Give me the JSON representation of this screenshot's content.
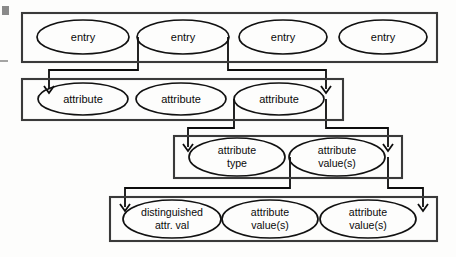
{
  "diagram": {
    "canvas": {
      "width": 456,
      "height": 257
    },
    "colors": {
      "box_stroke": "#3a3a3a",
      "ellipse_stroke": "#111111",
      "connector_stroke": "#0d0d0d",
      "text": "#0a0a0a",
      "background": "#fdfdfc",
      "edge_mark": "#8a8a8a"
    },
    "groups": [
      {
        "id": "entries-group",
        "name": "entry-group",
        "rect": {
          "x": 22,
          "y": 13,
          "w": 415,
          "h": 49
        },
        "nodes": [
          {
            "id": "entry-1",
            "label": "entry",
            "cx": 83,
            "cy": 37,
            "rx": 46,
            "ry": 17
          },
          {
            "id": "entry-2",
            "label": "entry",
            "cx": 183,
            "cy": 37,
            "rx": 46,
            "ry": 17
          },
          {
            "id": "entry-3",
            "label": "entry",
            "cx": 283,
            "cy": 37,
            "rx": 44,
            "ry": 17
          },
          {
            "id": "entry-4",
            "label": "entry",
            "cx": 383,
            "cy": 37,
            "rx": 44,
            "ry": 17
          }
        ]
      },
      {
        "id": "attributes-group",
        "name": "attribute-group",
        "rect": {
          "x": 22,
          "y": 79,
          "w": 321,
          "h": 41
        },
        "nodes": [
          {
            "id": "attribute-1",
            "label": "attribute",
            "cx": 83,
            "cy": 99,
            "rx": 45,
            "ry": 16
          },
          {
            "id": "attribute-2",
            "label": "attribute",
            "cx": 181,
            "cy": 99,
            "rx": 45,
            "ry": 16
          },
          {
            "id": "attribute-3",
            "label": "attribute",
            "cx": 279,
            "cy": 99,
            "rx": 45,
            "ry": 16
          }
        ]
      },
      {
        "id": "attribute-parts-group",
        "name": "attribute-parts-group",
        "rect": {
          "x": 174,
          "y": 136,
          "w": 228,
          "h": 42
        },
        "nodes": [
          {
            "id": "attribute-type",
            "label_line1": "attribute",
            "label_line2": "type",
            "cx": 237,
            "cy": 157,
            "rx": 48,
            "ry": 19
          },
          {
            "id": "attribute-values",
            "label_line1": "attribute",
            "label_line2": "value(s)",
            "cx": 337,
            "cy": 157,
            "rx": 48,
            "ry": 19
          }
        ]
      },
      {
        "id": "values-group",
        "name": "attribute-values-group",
        "rect": {
          "x": 110,
          "y": 197,
          "w": 327,
          "h": 44
        },
        "nodes": [
          {
            "id": "distinguished-attr-val",
            "label_line1": "distinguished",
            "label_line2": "attr. val",
            "cx": 172,
            "cy": 219,
            "rx": 49,
            "ry": 19
          },
          {
            "id": "attribute-values-2",
            "label_line1": "attribute",
            "label_line2": "value(s)",
            "cx": 270,
            "cy": 219,
            "rx": 48,
            "ry": 19
          },
          {
            "id": "attribute-values-3",
            "label_line1": "attribute",
            "label_line2": "value(s)",
            "cx": 368,
            "cy": 219,
            "rx": 48,
            "ry": 19
          }
        ]
      }
    ],
    "connectors": [
      {
        "id": "entry2-to-attributes-left",
        "name": "connector-entry-to-attribute-left",
        "from": "entry-2",
        "to": "attributes-group",
        "path": "M 138,37 L 138,70 L 49,70 L 49,89",
        "arrow": {
          "x": 49,
          "y": 93,
          "dir": "down"
        }
      },
      {
        "id": "entry2-to-attributes-right",
        "name": "connector-entry-to-attribute-right",
        "from": "entry-2",
        "to": "attributes-group",
        "path": "M 228,37 L 228,70 L 326,70 L 326,89",
        "arrow": {
          "x": 326,
          "y": 93,
          "dir": "down"
        }
      },
      {
        "id": "attribute3-to-parts-left",
        "name": "connector-attribute-to-parts-left",
        "from": "attribute-3",
        "to": "attribute-parts-group",
        "path": "M 234,99 L 234,128 L 188,128 L 188,147",
        "arrow": {
          "x": 188,
          "y": 151,
          "dir": "down"
        }
      },
      {
        "id": "attribute3-to-parts-right",
        "name": "connector-attribute-to-parts-right",
        "from": "attribute-3",
        "to": "attribute-parts-group",
        "path": "M 326,99 L 326,128 L 388,128 L 388,147",
        "arrow": {
          "x": 388,
          "y": 151,
          "dir": "down"
        }
      },
      {
        "id": "values-to-group-left",
        "name": "connector-values-to-group-left",
        "from": "attribute-values",
        "to": "values-group",
        "path": "M 290,157 L 290,188 L 125,188 L 125,207",
        "arrow": {
          "x": 125,
          "y": 211,
          "dir": "down"
        }
      },
      {
        "id": "values-to-group-right",
        "name": "connector-values-to-group-right",
        "from": "attribute-values",
        "to": "values-group",
        "path": "M 388,157 L 388,188 L 423,188 L 423,207",
        "arrow": {
          "x": 423,
          "y": 211,
          "dir": "down"
        }
      }
    ],
    "edge_marks": [
      {
        "id": "scan-mark-square",
        "name": "scan-artifact-square",
        "x": 2,
        "y": 6,
        "w": 7,
        "h": 9
      },
      {
        "id": "scan-mark-dash",
        "name": "scan-artifact-dash",
        "x1": 0,
        "y1": 61,
        "x2": 8,
        "y2": 61
      }
    ]
  }
}
